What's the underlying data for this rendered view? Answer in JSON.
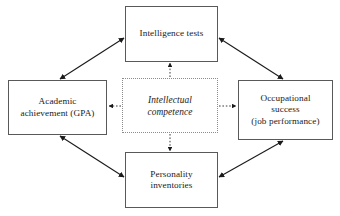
{
  "diagram": {
    "type": "conceptual-model-diagram",
    "canvas": {
      "width": 340,
      "height": 216,
      "background": "#ffffff"
    },
    "colors": {
      "box_border": "#595959",
      "dotted_border": "#8c8c8c",
      "arrow": "#1a1a1a",
      "text": "#1a1a1a",
      "background": "#ffffff"
    },
    "center_node": {
      "id": "intellectual-competence",
      "label": "Intellectual\ncompetence",
      "style": "dotted",
      "italic": true
    },
    "nodes": [
      {
        "id": "intelligence-tests",
        "label": "Intelligence tests",
        "position": "top"
      },
      {
        "id": "academic-achievement",
        "label": "Academic\nachievement (GPA)",
        "position": "left"
      },
      {
        "id": "occupational-success",
        "label": "Occupational\nsuccess\n(job performance)",
        "position": "right"
      },
      {
        "id": "personality-inventories",
        "label": "Personality\ninventories",
        "position": "bottom"
      }
    ],
    "edges": [
      {
        "from": "academic-achievement",
        "to": "intelligence-tests",
        "style": "solid",
        "arrowheads": "both"
      },
      {
        "from": "intelligence-tests",
        "to": "occupational-success",
        "style": "solid",
        "arrowheads": "both"
      },
      {
        "from": "academic-achievement",
        "to": "personality-inventories",
        "style": "solid",
        "arrowheads": "both"
      },
      {
        "from": "personality-inventories",
        "to": "occupational-success",
        "style": "solid",
        "arrowheads": "both"
      },
      {
        "from": "intellectual-competence",
        "to": "intelligence-tests",
        "style": "dotted",
        "arrowheads": "single"
      },
      {
        "from": "intellectual-competence",
        "to": "academic-achievement",
        "style": "dotted",
        "arrowheads": "single"
      },
      {
        "from": "intellectual-competence",
        "to": "occupational-success",
        "style": "dotted",
        "arrowheads": "single"
      },
      {
        "from": "intellectual-competence",
        "to": "personality-inventories",
        "style": "dotted",
        "arrowheads": "single"
      }
    ]
  }
}
